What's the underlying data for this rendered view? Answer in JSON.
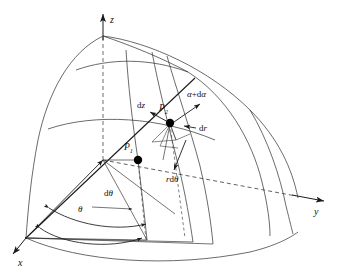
{
  "figure": {
    "background_color": "#ffffff",
    "line_color": "#2b2b2b",
    "dashed_color": "#4a4a4a",
    "point_color": "#000000",
    "label_color": "#111111",
    "width": 339,
    "height": 273
  },
  "axes": [
    {
      "id": "x",
      "label": "x",
      "direction": "down-left",
      "style": "solid-arrow"
    },
    {
      "id": "y",
      "label": "y",
      "direction": "right",
      "style": "dashed-then-solid-arrow"
    },
    {
      "id": "z",
      "label": "z",
      "direction": "up",
      "style": "dashed-then-solid-arrow"
    }
  ],
  "points": [
    {
      "id": "P1",
      "label": "P",
      "subscript": "1",
      "marker": "filled-circle"
    },
    {
      "id": "P2",
      "label": "P",
      "subscript": "2",
      "marker": "filled-circle"
    }
  ],
  "vectors": [
    {
      "id": "dz",
      "label": "dz",
      "upright_prefix": "d",
      "italic_part": "z",
      "direction": "up-left",
      "origin": "P2"
    },
    {
      "id": "dr",
      "label": "dr",
      "upright_prefix": "d",
      "italic_part": "r",
      "direction": "left",
      "origin": "P2"
    },
    {
      "id": "alpha-d-alpha",
      "label": "α+dα",
      "direction": "up-right",
      "origin": "P2"
    },
    {
      "id": "rdtheta",
      "label": "rdθ",
      "direction": "down-right",
      "origin": "P2"
    }
  ],
  "angles": [
    {
      "id": "theta",
      "label": "θ",
      "description": "azimuthal angle from x-axis"
    },
    {
      "id": "dtheta",
      "label": "dθ",
      "description": "differential azimuthal increment"
    }
  ],
  "surfaces": [
    {
      "id": "spherical-wedge",
      "description": "curved sector of a sphere/cylinder wedge"
    },
    {
      "id": "upper-arc",
      "description": "upper latitude arc"
    },
    {
      "id": "mid-arc",
      "description": "arc through P1 level"
    },
    {
      "id": "bottom-arc",
      "description": "base arc of the wedge"
    }
  ]
}
